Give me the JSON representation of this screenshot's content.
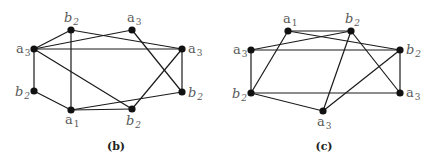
{
  "graphs": [
    {
      "id": "b",
      "caption": "(b)",
      "caption_pos": [
        116,
        150
      ],
      "nodes": [
        {
          "id": "b2_top",
          "letter": "b",
          "sub": "2",
          "x": 71,
          "y": 30,
          "label_pos": [
            64,
            22
          ],
          "anchor": "start"
        },
        {
          "id": "a3_top",
          "letter": "a",
          "sub": "3",
          "x": 132,
          "y": 30,
          "label_pos": [
            127,
            22
          ],
          "anchor": "start"
        },
        {
          "id": "a3_left",
          "letter": "a",
          "sub": "3",
          "x": 34,
          "y": 49,
          "label_pos": [
            16,
            53
          ],
          "anchor": "start"
        },
        {
          "id": "a3_right",
          "letter": "a",
          "sub": "3",
          "x": 182,
          "y": 49,
          "label_pos": [
            188,
            53
          ],
          "anchor": "start"
        },
        {
          "id": "b2_left",
          "letter": "b",
          "sub": "2",
          "x": 34,
          "y": 91,
          "label_pos": [
            15,
            96
          ],
          "anchor": "start"
        },
        {
          "id": "b2_right",
          "letter": "b",
          "sub": "2",
          "x": 182,
          "y": 92,
          "label_pos": [
            188,
            97
          ],
          "anchor": "start"
        },
        {
          "id": "a1_bot",
          "letter": "a",
          "sub": "1",
          "x": 71,
          "y": 110,
          "label_pos": [
            65,
            124
          ],
          "anchor": "start"
        },
        {
          "id": "b2_bot",
          "letter": "b",
          "sub": "2",
          "x": 132,
          "y": 109,
          "label_pos": [
            126,
            125
          ],
          "anchor": "start"
        }
      ],
      "edges": [
        [
          "a3_left",
          "b2_top"
        ],
        [
          "a3_left",
          "a3_top"
        ],
        [
          "a3_left",
          "a3_right"
        ],
        [
          "a3_left",
          "b2_bot"
        ],
        [
          "a3_left",
          "b2_left"
        ],
        [
          "b2_top",
          "a1_bot"
        ],
        [
          "b2_top",
          "a3_right"
        ],
        [
          "a3_top",
          "b2_right"
        ],
        [
          "a3_right",
          "b2_right"
        ],
        [
          "a3_right",
          "b2_bot"
        ],
        [
          "b2_left",
          "a1_bot"
        ],
        [
          "a1_bot",
          "b2_right"
        ],
        [
          "a1_bot",
          "b2_bot"
        ]
      ]
    },
    {
      "id": "c",
      "caption": "(c)",
      "caption_pos": [
        324,
        150
      ],
      "nodes": [
        {
          "id": "a1_top",
          "letter": "a",
          "sub": "1",
          "x": 288,
          "y": 31,
          "label_pos": [
            283,
            23
          ],
          "anchor": "start"
        },
        {
          "id": "b2_top",
          "letter": "b",
          "sub": "2",
          "x": 351,
          "y": 31,
          "label_pos": [
            345,
            23
          ],
          "anchor": "start"
        },
        {
          "id": "a3_left",
          "letter": "a",
          "sub": "3",
          "x": 251,
          "y": 50,
          "label_pos": [
            233,
            54
          ],
          "anchor": "start"
        },
        {
          "id": "b2_right",
          "letter": "b",
          "sub": "2",
          "x": 400,
          "y": 50,
          "label_pos": [
            406,
            54
          ],
          "anchor": "start"
        },
        {
          "id": "b2_left",
          "letter": "b",
          "sub": "2",
          "x": 251,
          "y": 93,
          "label_pos": [
            232,
            98
          ],
          "anchor": "start"
        },
        {
          "id": "a3_right",
          "letter": "a",
          "sub": "3",
          "x": 400,
          "y": 93,
          "label_pos": [
            406,
            97
          ],
          "anchor": "start"
        },
        {
          "id": "a3_bot",
          "letter": "a",
          "sub": "3",
          "x": 323,
          "y": 111,
          "label_pos": [
            317,
            126
          ],
          "anchor": "start"
        }
      ],
      "edges": [
        [
          "a1_top",
          "b2_top"
        ],
        [
          "a1_top",
          "b2_right"
        ],
        [
          "a1_top",
          "b2_left"
        ],
        [
          "b2_top",
          "a3_left"
        ],
        [
          "b2_top",
          "a3_right"
        ],
        [
          "b2_top",
          "a3_bot"
        ],
        [
          "a3_left",
          "b2_right"
        ],
        [
          "a3_left",
          "b2_left"
        ],
        [
          "b2_right",
          "a3_right"
        ],
        [
          "b2_right",
          "a3_bot"
        ],
        [
          "b2_left",
          "a3_right"
        ],
        [
          "b2_left",
          "a3_bot"
        ]
      ]
    }
  ],
  "style": {
    "edge_color": "#1a1a1a",
    "node_color": "#111111",
    "label_color": "#5a5a5a",
    "node_radius": 3.6
  }
}
